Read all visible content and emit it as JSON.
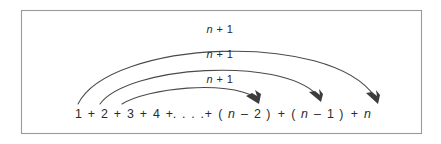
{
  "figure": {
    "background_color": "#ffffff",
    "frame": {
      "border_color": "#9a9a9a",
      "x": 21,
      "y": 10,
      "width": 401,
      "height": 124
    },
    "ink_color": "#2b2b2b",
    "arc_color": "#4a4a4a"
  },
  "equation": {
    "full_text": "1 + 2 + 3 + 4 + . . . . + ( n – 2 ) + ( n – 1 ) + n",
    "terms": [
      {
        "text": "1",
        "italic": false,
        "x": 79
      },
      {
        "text": "+",
        "italic": false,
        "x": 92
      },
      {
        "text": "2",
        "italic": false,
        "x": 105
      },
      {
        "text": "+",
        "italic": false,
        "x": 118
      },
      {
        "text": "3",
        "italic": false,
        "x": 131
      },
      {
        "text": "+",
        "italic": false,
        "x": 144
      },
      {
        "text": "4",
        "italic": false,
        "x": 157
      },
      {
        "text": "+",
        "italic": false,
        "x": 170
      },
      {
        "text": ". . . .",
        "italic": false,
        "x": 189
      },
      {
        "text": "+",
        "italic": false,
        "x": 209
      },
      {
        "text": "(",
        "italic": false,
        "x": 221
      },
      {
        "text": "n",
        "italic": true,
        "x": 232
      },
      {
        "text": "–",
        "italic": false,
        "x": 245
      },
      {
        "text": "2",
        "italic": false,
        "x": 258
      },
      {
        "text": ")",
        "italic": false,
        "x": 269
      },
      {
        "text": "+",
        "italic": false,
        "x": 282
      },
      {
        "text": "(",
        "italic": false,
        "x": 294
      },
      {
        "text": "n",
        "italic": true,
        "x": 305
      },
      {
        "text": "–",
        "italic": false,
        "x": 318
      },
      {
        "text": "1",
        "italic": false,
        "x": 331
      },
      {
        "text": ")",
        "italic": false,
        "x": 342
      },
      {
        "text": "+",
        "italic": false,
        "x": 355
      },
      {
        "text": "n",
        "italic": true,
        "x": 368
      }
    ],
    "baseline_y": 118
  },
  "arcs": [
    {
      "id": "arc-outer",
      "label": "n + 1",
      "label_var": "n",
      "label_rest": " + 1",
      "label_x": 220,
      "label_y": 33,
      "from_term": "1",
      "to_term": "n",
      "path": "M 78 104 C 110 40, 330 30, 375 97",
      "arrow_tip_x": 378,
      "arrow_tip_y": 104,
      "arrow_angle": 57
    },
    {
      "id": "arc-middle",
      "label": "n + 1",
      "label_var": "n",
      "label_rest": " + 1",
      "label_x": 220,
      "label_y": 58,
      "from_term": "2",
      "to_term": "n – 1",
      "path": "M 100 104 C 128 66, 280 56, 317 95",
      "arrow_tip_x": 321,
      "arrow_tip_y": 102,
      "arrow_angle": 57
    },
    {
      "id": "arc-inner",
      "label": "n + 1",
      "label_var": "n",
      "label_rest": " + 1",
      "label_x": 220,
      "label_y": 83,
      "from_term": "3",
      "to_term": "n – 2",
      "path": "M 122 104 C 148 88, 226 80, 255 97",
      "arrow_tip_x": 259,
      "arrow_tip_y": 104,
      "arrow_angle": 50
    }
  ]
}
